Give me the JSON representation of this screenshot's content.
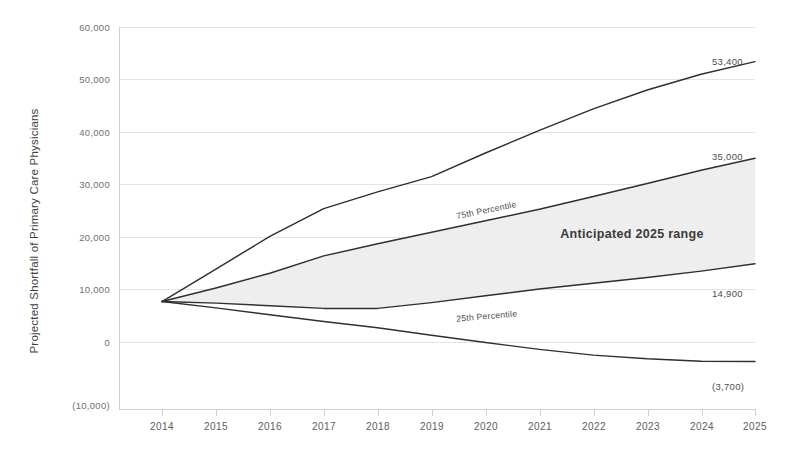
{
  "chart_data": {
    "type": "line",
    "title": "",
    "xlabel": "",
    "ylabel": "Projected Shortfall of Primary Care Physicians",
    "x": [
      2014,
      2015,
      2016,
      2017,
      2018,
      2019,
      2020,
      2021,
      2022,
      2023,
      2024,
      2025
    ],
    "xtick_labels": [
      "2014",
      "2015",
      "2016",
      "2017",
      "2018",
      "2019",
      "2020",
      "2021",
      "2022",
      "2023",
      "2024",
      "2025"
    ],
    "ytick_values": [
      -10000,
      0,
      10000,
      20000,
      30000,
      40000,
      50000,
      60000
    ],
    "ytick_labels": [
      "(10,000)",
      "0",
      "10,000",
      "20,000",
      "30,000",
      "40,000",
      "50,000",
      "60,000"
    ],
    "ylim": [
      -10000,
      60000
    ],
    "xlim": [
      2014,
      2025
    ],
    "grid": true,
    "legend_position": "inline",
    "series": [
      {
        "name": "Upper bound",
        "end_label": "53,400",
        "values": [
          7700,
          13900,
          20100,
          25400,
          28600,
          31500,
          36000,
          40300,
          44400,
          48000,
          51000,
          53400
        ]
      },
      {
        "name": "75th Percentile",
        "inline_label": "75th Percentile",
        "end_label": "35,000",
        "values": [
          7700,
          10300,
          13100,
          16400,
          18700,
          20900,
          23100,
          25300,
          27700,
          30200,
          32700,
          35000
        ]
      },
      {
        "name": "25th Percentile",
        "inline_label": "25th Percentile",
        "end_label": "14,900",
        "values": [
          7700,
          7400,
          6900,
          6400,
          6400,
          7500,
          8800,
          10100,
          11200,
          12300,
          13500,
          14900
        ]
      },
      {
        "name": "Lower bound",
        "end_label": "(3,700)",
        "values": [
          7700,
          6500,
          5200,
          3900,
          2700,
          1300,
          -100,
          -1400,
          -2500,
          -3200,
          -3650,
          -3700
        ]
      }
    ],
    "band": {
      "label": "Anticipated 2025 range",
      "upper_series": "75th Percentile",
      "lower_series": "25th Percentile",
      "fill_color": "#eeeeee"
    },
    "colors": {
      "line": "#2f2f2f",
      "grid": "#e4e4e4",
      "axis": "#cfcfcf",
      "text": "#4a4a4a",
      "band_fill": "#eeeeee"
    }
  }
}
